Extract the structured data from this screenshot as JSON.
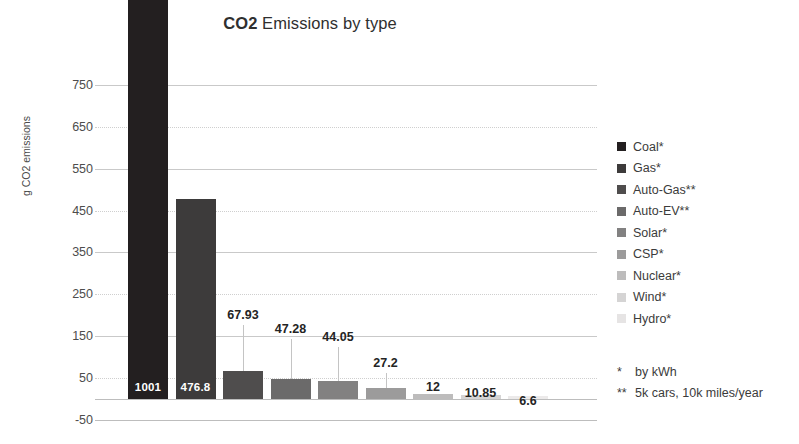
{
  "chart_data": {
    "type": "bar",
    "title": "CO2 Emissions by type",
    "title_strong": "CO2",
    "title_rest": " Emissions by type",
    "xlabel": "",
    "ylabel": "g CO2 emissions",
    "ylim": [
      -50,
      800
    ],
    "yticks": [
      750,
      650,
      550,
      450,
      350,
      250,
      150,
      50,
      -50
    ],
    "grid": true,
    "legend_position": "right",
    "categories": [
      "Coal*",
      "Gas*",
      "Auto-Gas**",
      "Auto-EV**",
      "Solar*",
      "CSP*",
      "Nuclear*",
      "Wind*",
      "Hydro*"
    ],
    "values": [
      1001,
      476.8,
      67.93,
      47.28,
      44.05,
      27.2,
      12,
      10.85,
      6.6
    ],
    "value_labels": [
      "1001",
      "476.8",
      "67.93",
      "47.28",
      "44.05",
      "27.2",
      "12",
      "10.85",
      "6.6"
    ],
    "colors": [
      "#231f20",
      "#3d3b3b",
      "#4f4d4d",
      "#6b6a6a",
      "#828181",
      "#9c9b9b",
      "#bdbcbc",
      "#d5d4d4",
      "#eceaea"
    ],
    "label_inside": [
      true,
      true,
      false,
      false,
      false,
      false,
      false,
      false,
      false
    ]
  },
  "legend": {
    "items": [
      {
        "label": "Coal*",
        "color": "#231f20"
      },
      {
        "label": "Gas*",
        "color": "#3d3b3b"
      },
      {
        "label": "Auto-Gas**",
        "color": "#4f4d4d"
      },
      {
        "label": "Auto-EV**",
        "color": "#6b6a6a"
      },
      {
        "label": "Solar*",
        "color": "#828181"
      },
      {
        "label": "CSP*",
        "color": "#9c9b9b"
      },
      {
        "label": "Nuclear*",
        "color": "#bdbcbc"
      },
      {
        "label": "Wind*",
        "color": "#d5d4d4"
      },
      {
        "label": "Hydro*",
        "color": "#e6e4e4"
      }
    ]
  },
  "footnotes": [
    {
      "mark": "*",
      "text": "by kWh"
    },
    {
      "mark": "**",
      "text": "5k cars, 10k miles/year"
    }
  ]
}
